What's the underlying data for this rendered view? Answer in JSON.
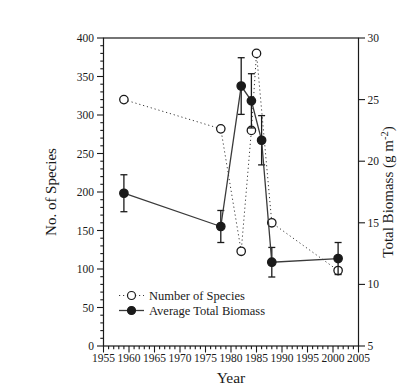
{
  "figure": {
    "background": "#ffffff",
    "ink_color": "#1a1a1a",
    "line_color": "#3a3a3a"
  },
  "chart_data": {
    "type": "line",
    "title": "",
    "xlabel": "Year",
    "ylabel_left": "No. of Species",
    "ylabel_right": "Total Biomass (g m⁻²)",
    "ylabel_right_parts": {
      "pre": "Total Biomass (g m",
      "sup": "-2",
      "post": ")"
    },
    "x_range": [
      1955,
      2005
    ],
    "x_major_ticks": [
      1955,
      1960,
      1965,
      1970,
      1975,
      1980,
      1985,
      1990,
      1995,
      2000,
      2005
    ],
    "x_minor_step": 1,
    "y_left_range": [
      0,
      400
    ],
    "y_left_major_ticks": [
      0,
      50,
      100,
      150,
      200,
      250,
      300,
      350,
      400
    ],
    "y_left_minor_step": 10,
    "y_right_range": [
      5,
      30
    ],
    "y_right_major_ticks": [
      5,
      10,
      15,
      20,
      25,
      30
    ],
    "grid": false,
    "legend_position": "lower-left-inside",
    "series": [
      {
        "name": "Number of Species",
        "axis": "left",
        "marker": "open-circle",
        "line_style": "dotted",
        "points": [
          [
            1959,
            320
          ],
          [
            1978,
            282
          ],
          [
            1982,
            123
          ],
          [
            1984,
            280
          ],
          [
            1985,
            380
          ],
          [
            1988,
            160
          ],
          [
            2001,
            98
          ]
        ]
      },
      {
        "name": "Average Total Biomass",
        "axis": "right",
        "marker": "filled-circle",
        "line_style": "solid",
        "points": [
          [
            1959,
            17.4
          ],
          [
            1978,
            14.7
          ],
          [
            1982,
            26.1
          ],
          [
            1984,
            24.9
          ],
          [
            1986,
            21.7
          ],
          [
            1988,
            11.8
          ],
          [
            2001,
            12.1
          ]
        ],
        "errors": [
          1.5,
          1.3,
          2.3,
          2.2,
          2.0,
          1.2,
          1.3
        ]
      }
    ]
  }
}
